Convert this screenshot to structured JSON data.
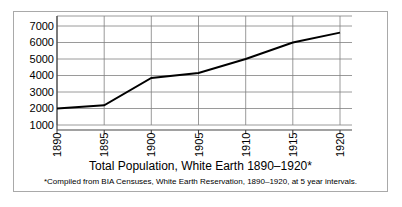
{
  "chart_data": {
    "type": "line",
    "title": "Total Population, White Earth 1890–1920*",
    "footnote": "*Compiled from BIA Censuses, White Earth Reservation, 1890–1920, at 5 year intervals.",
    "xlabel": "",
    "ylabel": "",
    "categories": [
      "1890",
      "1895",
      "1900",
      "1905",
      "1910",
      "1915",
      "1920"
    ],
    "x": [
      1890,
      1895,
      1900,
      1905,
      1910,
      1915,
      1920
    ],
    "values": [
      2000,
      2200,
      3850,
      4150,
      5000,
      6000,
      6600
    ],
    "series": [
      {
        "name": "Total Population",
        "values": [
          2000,
          2200,
          3850,
          4150,
          5000,
          6000,
          6600
        ]
      }
    ],
    "ylim": [
      1000,
      7000
    ],
    "xlim": [
      1890,
      1920
    ],
    "yticks": [
      1000,
      2000,
      3000,
      4000,
      5000,
      6000,
      7000
    ],
    "ytick_labels": [
      "1000",
      "2000",
      "3000",
      "4000",
      "5000",
      "6000",
      "7000"
    ],
    "xtick_labels": [
      "1890",
      "1895",
      "1900",
      "1905",
      "1910",
      "1915",
      "1920"
    ],
    "grid": true,
    "grid_axis": "both",
    "legend": false,
    "legend_position": "none",
    "line_color": "#000000",
    "grid_color": "#808080",
    "axis_color": "#555555",
    "background_color": "#ffffff",
    "frame_color": "#a9a9a9"
  },
  "axis": {
    "y_tick_1": "1000",
    "y_tick_2": "2000",
    "y_tick_3": "3000",
    "y_tick_4": "4000",
    "y_tick_5": "5000",
    "y_tick_6": "6000",
    "y_tick_7": "7000",
    "x_tick_1": "1890",
    "x_tick_2": "1895",
    "x_tick_3": "1900",
    "x_tick_4": "1905",
    "x_tick_5": "1910",
    "x_tick_6": "1915",
    "x_tick_7": "1920"
  }
}
